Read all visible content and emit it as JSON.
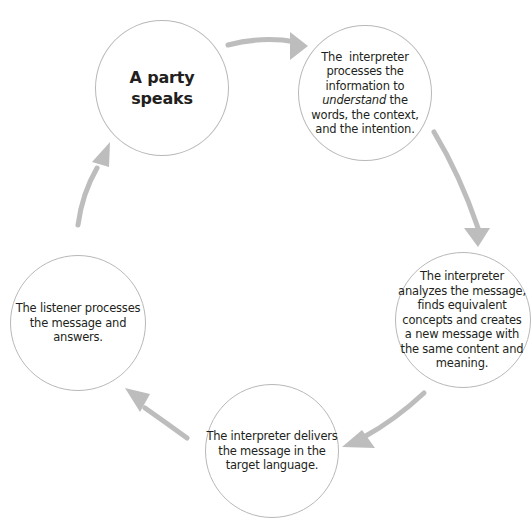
{
  "diagram": {
    "type": "cycle",
    "arrow_color": "#bdbdbd",
    "circle_border_color": "#b8b8b8",
    "text_color": "#231f20",
    "nodes": [
      {
        "id": "speaker",
        "lines": [
          "A party",
          "speaks"
        ],
        "emphasis": "bold"
      },
      {
        "id": "interpreter-understands",
        "line1": "The  interpreter",
        "line2": "processes the",
        "line3": "information to",
        "line4_italic": "understand",
        "line4_rest": " the",
        "line5": "words, the context,",
        "line6": "and the intention."
      },
      {
        "id": "interpreter-analyzes",
        "lines": [
          "The interpreter",
          "analyzes the message,",
          "finds equivalent",
          "concepts and creates",
          "a new message with",
          "the same content and",
          "meaning."
        ]
      },
      {
        "id": "interpreter-delivers",
        "lines": [
          "The interpreter delivers",
          "the message in the",
          "target language."
        ]
      },
      {
        "id": "listener",
        "lines": [
          "The listener processes",
          "the message and",
          "answers."
        ]
      }
    ],
    "edges": [
      {
        "from": "speaker",
        "to": "interpreter-understands"
      },
      {
        "from": "interpreter-understands",
        "to": "interpreter-analyzes"
      },
      {
        "from": "interpreter-analyzes",
        "to": "interpreter-delivers"
      },
      {
        "from": "interpreter-delivers",
        "to": "listener"
      },
      {
        "from": "listener",
        "to": "speaker"
      }
    ]
  }
}
